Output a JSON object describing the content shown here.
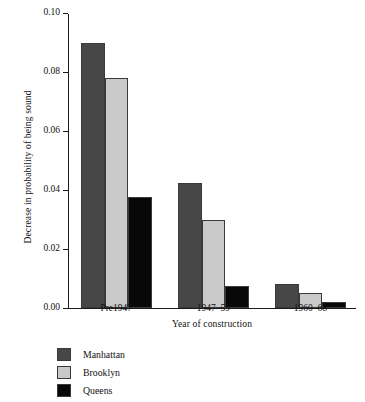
{
  "chart_data": {
    "type": "bar",
    "title": "",
    "subtitle": "",
    "xlabel": "Year of construction",
    "ylabel": "Decrease in probability of being sound",
    "categories": [
      "Pre1947",
      "1947–59",
      "1960–68"
    ],
    "series": [
      {
        "name": "Manhattan",
        "color": "#474747",
        "values": [
          0.09,
          0.0425,
          0.008
        ]
      },
      {
        "name": "Brooklyn",
        "color": "#c9c9c9",
        "values": [
          0.078,
          0.03,
          0.005
        ]
      },
      {
        "name": "Queens",
        "color": "#080808",
        "values": [
          0.0375,
          0.0075,
          0.002
        ]
      }
    ],
    "ylim": [
      0.0,
      0.1
    ],
    "yticks": [
      0.0,
      0.02,
      0.04,
      0.06,
      0.08,
      0.1
    ],
    "ytick_labels": [
      "0.00",
      "0.02",
      "0.04",
      "0.06",
      "0.08",
      "0.10"
    ],
    "grid": false,
    "legend_position": "bottom-left",
    "legend_entries": [
      "Manhattan",
      "Brooklyn",
      "Queens"
    ]
  },
  "colors": {
    "background": "#ffffff",
    "axis": "#1b1b1b",
    "text": "#111111",
    "manhattan": "#474747",
    "brooklyn": "#c9c9c9",
    "queens": "#080808"
  }
}
